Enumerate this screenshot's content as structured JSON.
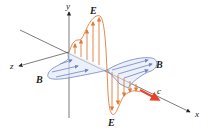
{
  "diagram": {
    "axes": {
      "x": "x",
      "y": "y",
      "z": "z"
    },
    "labels": {
      "e_top": "E",
      "e_bottom": "E",
      "b_left": "B",
      "b_right": "B",
      "speed": "c"
    },
    "colors": {
      "electric_field": "#e07b39",
      "magnetic_field": "#6e84c4",
      "velocity_arrow": "#e8432a",
      "axis": "#333333"
    }
  }
}
